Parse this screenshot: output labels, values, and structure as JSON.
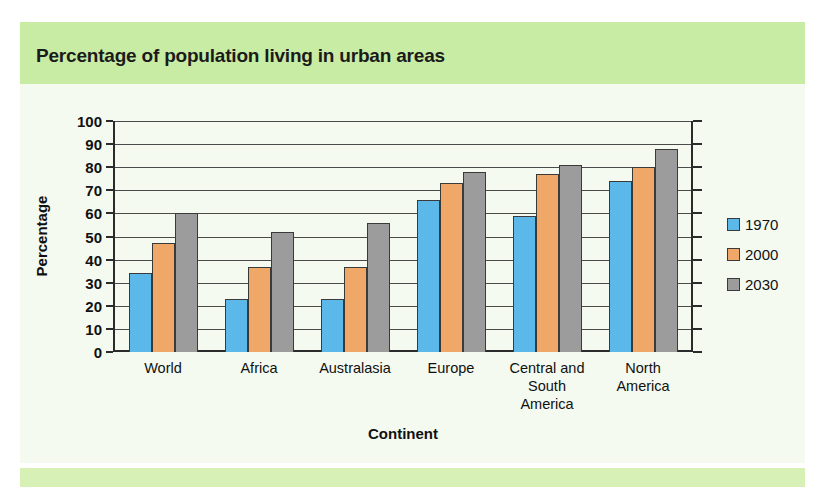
{
  "title": "Percentage of population living in urban areas",
  "legend": {
    "position": "right",
    "entries": [
      {
        "label": "1970",
        "color": "#5cb8e8"
      },
      {
        "label": "2000",
        "color": "#f0a868"
      },
      {
        "label": "2030",
        "color": "#9c9c9c"
      }
    ]
  },
  "axes": {
    "ylabel": "Percentage",
    "xlabel": "Continent",
    "yticks": [
      "100",
      "90",
      "80",
      "70",
      "60",
      "50",
      "40",
      "30",
      "20",
      "10",
      "0"
    ]
  },
  "colors": {
    "title_band": "#c9eca4",
    "panel": "#f4faf0",
    "bottom_band": "#d6f0b6",
    "series_1970": "#5cb8e8",
    "series_2000": "#f0a868",
    "series_2030": "#9c9c9c",
    "axis": "#2b2b2b",
    "grid": "#4a4a4a"
  },
  "chart_data": {
    "type": "bar",
    "title": "Percentage of population living in urban areas",
    "xlabel": "Continent",
    "ylabel": "Percentage",
    "ylim": [
      0,
      100
    ],
    "ytick_step": 10,
    "grid": true,
    "legend_position": "right",
    "categories": [
      "World",
      "Africa",
      "Australasia",
      "Europe",
      "Central and\nSouth\nAmerica",
      "North\nAmerica"
    ],
    "series": [
      {
        "name": "1970",
        "color": "#5cb8e8",
        "values": [
          34,
          23,
          23,
          66,
          59,
          74
        ]
      },
      {
        "name": "2000",
        "color": "#f0a868",
        "values": [
          47,
          37,
          37,
          73,
          77,
          80
        ]
      },
      {
        "name": "2030",
        "color": "#9c9c9c",
        "values": [
          60,
          52,
          56,
          78,
          81,
          88
        ]
      }
    ]
  }
}
